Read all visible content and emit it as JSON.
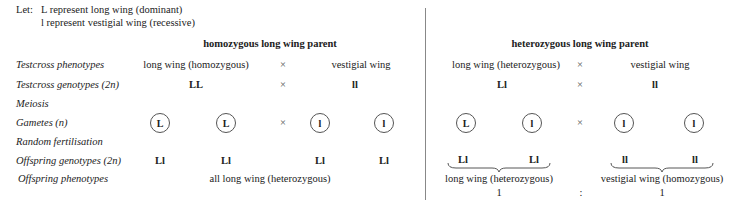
{
  "legend": {
    "prefix": "Let:",
    "line1": "L  represent long wing (dominant)",
    "line2": "l represent vestigial wing (recessive)"
  },
  "row_labels": {
    "testcross_phenotypes": "Testcross phenotypes",
    "testcross_genotypes": "Testcross genotypes (2n)",
    "meiosis": "Meiosis",
    "gametes": "Gametes (n)",
    "random_fertilisation": "Random fertilisation",
    "offspring_genotypes": "Offspring genotypes (2n)",
    "offspring_phenotypes": "Offspring phenotypes"
  },
  "cross_symbol": "×",
  "homozygous": {
    "title": "homozygous long wing parent",
    "parent1_phenotype": "long wing  (homozygous)",
    "parent2_phenotype": "vestigial wing",
    "parent1_genotype": "LL",
    "parent2_genotype": "ll",
    "gametes": [
      "L",
      "L",
      "l",
      "l"
    ],
    "offspring": [
      "Ll",
      "Ll",
      "Ll",
      "Ll"
    ],
    "offspring_phenotype": "all long wing (heterozygous)"
  },
  "heterozygous": {
    "title": "heterozygous long wing parent",
    "parent1_phenotype": "long wing  (heterozygous)",
    "parent2_phenotype": "vestigial wing",
    "parent1_genotype": "Ll",
    "parent2_genotype": "ll",
    "gametes": [
      "L",
      "l",
      "l",
      "l"
    ],
    "offspring": [
      "Ll",
      "Ll",
      "ll",
      "ll"
    ],
    "phenotype_a": "long wing (heterozygous)",
    "phenotype_b": "vestigial wing  (homozygous)",
    "ratio_a": "1",
    "ratio_sep": ":",
    "ratio_b": "1"
  }
}
